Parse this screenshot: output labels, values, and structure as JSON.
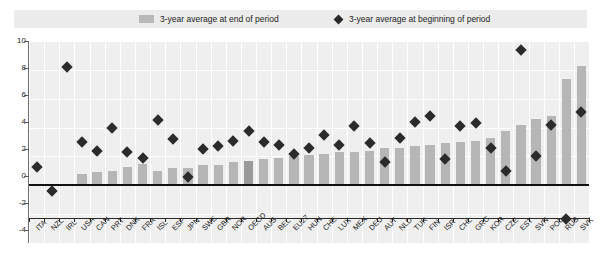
{
  "legend": {
    "items": [
      {
        "label": "3-year average at end of period",
        "marker": "square-swatch",
        "color": "#b9b9b9"
      },
      {
        "label": "3-year average at beginning of period",
        "marker": "diamond-marker",
        "color": "#2a2a2a"
      }
    ]
  },
  "axis": {
    "y_ticks": [
      "10",
      "8",
      "6",
      "4",
      "2",
      "0",
      "-2",
      "-4"
    ]
  },
  "chart_data": {
    "type": "bar",
    "title": "",
    "subtitle": "",
    "xlabel": "",
    "ylabel": "",
    "ylim": [
      -4,
      10
    ],
    "ytick_step": 2,
    "grid": true,
    "legend_position": "top",
    "highlight_category": "OECD",
    "categories": [
      "ITA",
      "NZL",
      "IRL",
      "USA",
      "CAN",
      "PRT",
      "DNK",
      "FRA",
      "ISL",
      "ESP",
      "JPN",
      "SWE",
      "GBR",
      "NOR",
      "OECD",
      "AUS",
      "BEL",
      "EU27",
      "HUN",
      "CHE",
      "LUX",
      "MEX",
      "DEU",
      "AUT",
      "NLD",
      "TUR",
      "FIN",
      "ISR",
      "CHL",
      "GRC",
      "KOR",
      "CZE",
      "EST",
      "SVN",
      "POL",
      "RUS",
      "SVK"
    ],
    "series": [
      {
        "name": "3-year average at end of period",
        "type": "bar",
        "color": "#b6b6b6",
        "values": [
          0.1,
          0.1,
          0.1,
          0.8,
          0.9,
          1.0,
          1.3,
          1.5,
          1.0,
          1.2,
          1.2,
          1.4,
          1.4,
          1.6,
          1.7,
          1.8,
          1.9,
          2.0,
          2.1,
          2.2,
          2.3,
          2.3,
          2.4,
          2.6,
          2.6,
          2.7,
          2.8,
          2.9,
          3.0,
          3.1,
          3.3,
          3.8,
          4.2,
          4.6,
          4.8,
          7.4,
          8.3
        ]
      },
      {
        "name": "3-year average at beginning of period",
        "type": "scatter",
        "color": "#2b2b2b",
        "values": [
          1.3,
          -0.4,
          8.2,
          3.0,
          2.4,
          4.0,
          2.3,
          1.9,
          4.5,
          3.2,
          0.6,
          2.5,
          2.7,
          3.1,
          3.8,
          3.0,
          2.8,
          2.2,
          2.6,
          3.5,
          2.8,
          4.1,
          2.9,
          1.6,
          3.3,
          4.4,
          4.8,
          1.8,
          4.1,
          4.3,
          2.6,
          1.0,
          9.4,
          2.0,
          4.2,
          -2.3,
          5.1
        ]
      }
    ]
  }
}
